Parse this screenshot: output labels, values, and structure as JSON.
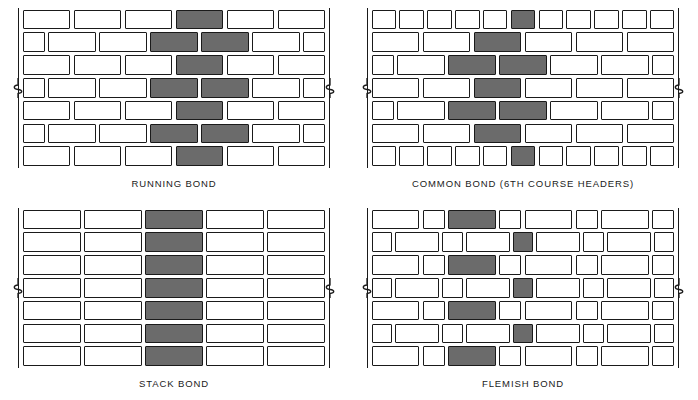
{
  "figure": {
    "title_implicit": "Masonry Brick Bond Patterns",
    "brick_fill_white": "#ffffff",
    "brick_fill_shaded": "#6b6b6b",
    "line_color": "#1a1a1a",
    "background": "#ffffff"
  },
  "panels": [
    {
      "id": "running-bond",
      "caption": "RUNNING BOND",
      "x": 18,
      "y": 8,
      "wall_width": 312,
      "wall_height": 160,
      "rows": 7,
      "row_height": 22.8,
      "brick_gap": 3.2,
      "description": "All stretcher courses, each course offset one half brick from the course below.",
      "courses": [
        {
          "offset": 0.0,
          "units": [
            "S",
            "S",
            "S",
            "S",
            "S",
            "S"
          ],
          "shaded_index": [
            3
          ]
        },
        {
          "offset": 0.5,
          "units": [
            "H",
            "S",
            "S",
            "S",
            "S",
            "S",
            "H"
          ],
          "shaded_index": [
            3,
            4
          ]
        },
        {
          "offset": 0.0,
          "units": [
            "S",
            "S",
            "S",
            "S",
            "S",
            "S"
          ],
          "shaded_index": [
            3
          ]
        },
        {
          "offset": 0.5,
          "units": [
            "H",
            "S",
            "S",
            "S",
            "S",
            "S",
            "H"
          ],
          "shaded_index": [
            3,
            4
          ]
        },
        {
          "offset": 0.0,
          "units": [
            "S",
            "S",
            "S",
            "S",
            "S",
            "S"
          ],
          "shaded_index": [
            3
          ]
        },
        {
          "offset": 0.5,
          "units": [
            "H",
            "S",
            "S",
            "S",
            "S",
            "S",
            "H"
          ],
          "shaded_index": [
            3,
            4
          ]
        },
        {
          "offset": 0.0,
          "units": [
            "S",
            "S",
            "S",
            "S",
            "S",
            "S"
          ],
          "shaded_index": [
            3
          ]
        }
      ]
    },
    {
      "id": "common-bond",
      "caption": "COMMON BOND (6TH COURSE HEADERS)",
      "x": 367,
      "y": 8,
      "wall_width": 312,
      "wall_height": 160,
      "rows": 7,
      "row_height": 22.8,
      "brick_gap": 3.2,
      "header_units": 11,
      "header_shaded_index": 5,
      "description": "Stretcher courses with a full course of headers every sixth course.",
      "courses": [
        {
          "type": "header",
          "units": 11,
          "shaded_index": [
            5
          ]
        },
        {
          "type": "stretcher",
          "offset": 0.0,
          "units": [
            "S",
            "S",
            "S",
            "S",
            "S",
            "S"
          ],
          "shaded_index": [
            2
          ]
        },
        {
          "type": "stretcher",
          "offset": 0.5,
          "units": [
            "H",
            "S",
            "S",
            "S",
            "S",
            "S",
            "H"
          ],
          "shaded_index": [
            2,
            3
          ]
        },
        {
          "type": "stretcher",
          "offset": 0.0,
          "units": [
            "S",
            "S",
            "S",
            "S",
            "S",
            "S"
          ],
          "shaded_index": [
            2
          ]
        },
        {
          "type": "stretcher",
          "offset": 0.5,
          "units": [
            "H",
            "S",
            "S",
            "S",
            "S",
            "S",
            "H"
          ],
          "shaded_index": [
            2,
            3
          ]
        },
        {
          "type": "stretcher",
          "offset": 0.0,
          "units": [
            "S",
            "S",
            "S",
            "S",
            "S",
            "S"
          ],
          "shaded_index": [
            2
          ]
        },
        {
          "type": "header",
          "units": 11,
          "shaded_index": [
            5
          ]
        }
      ]
    },
    {
      "id": "stack-bond",
      "caption": "STACK BOND",
      "x": 18,
      "y": 208,
      "wall_width": 312,
      "wall_height": 160,
      "rows": 7,
      "columns": 5,
      "row_height": 22.8,
      "brick_gap": 3.2,
      "shaded_column": 2,
      "description": "All courses aligned vertically; no offset between courses."
    },
    {
      "id": "flemish-bond",
      "caption": "FLEMISH BOND",
      "x": 367,
      "y": 208,
      "wall_width": 312,
      "wall_height": 160,
      "rows": 7,
      "row_height": 22.8,
      "brick_gap": 3.2,
      "description": "Each course alternates stretchers and headers; headers centered over stretchers below.",
      "courses": [
        {
          "offset": 0.0,
          "units": [
            "S",
            "H",
            "S",
            "H",
            "S",
            "H",
            "S",
            "H"
          ],
          "shaded_index": [
            2
          ]
        },
        {
          "offset": 0.5,
          "units": [
            "H",
            "S",
            "H",
            "S",
            "H",
            "S",
            "H",
            "S",
            "H"
          ],
          "shaded_index": [
            4
          ]
        },
        {
          "offset": 0.0,
          "units": [
            "S",
            "H",
            "S",
            "H",
            "S",
            "H",
            "S",
            "H"
          ],
          "shaded_index": [
            2
          ]
        },
        {
          "offset": 0.5,
          "units": [
            "H",
            "S",
            "H",
            "S",
            "H",
            "S",
            "H",
            "S",
            "H"
          ],
          "shaded_index": [
            4
          ]
        },
        {
          "offset": 0.0,
          "units": [
            "S",
            "H",
            "S",
            "H",
            "S",
            "H",
            "S",
            "H"
          ],
          "shaded_index": [
            2
          ]
        },
        {
          "offset": 0.5,
          "units": [
            "H",
            "S",
            "H",
            "S",
            "H",
            "S",
            "H",
            "S",
            "H"
          ],
          "shaded_index": [
            4
          ]
        },
        {
          "offset": 0.0,
          "units": [
            "S",
            "H",
            "S",
            "H",
            "S",
            "H",
            "S",
            "H"
          ],
          "shaded_index": [
            2
          ]
        }
      ]
    }
  ],
  "break_marks": {
    "symbol": "break-line-squiggle",
    "row_index": 3,
    "count_per_panel": 2,
    "sides": [
      "left",
      "right"
    ]
  }
}
